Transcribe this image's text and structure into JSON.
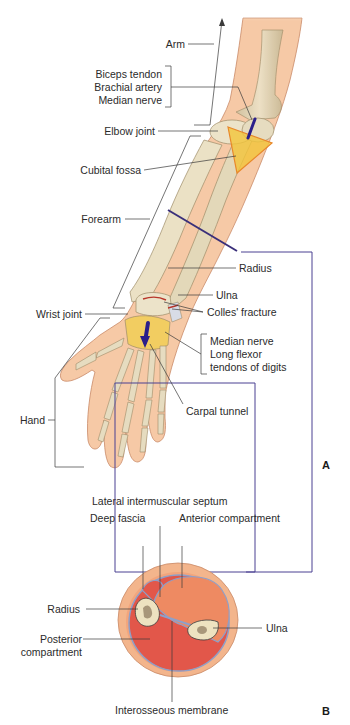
{
  "figure": {
    "panel_a": {
      "letter": "A",
      "labels": {
        "arm": "Arm",
        "biceps_tendon": "Biceps tendon",
        "brachial_artery": "Brachial artery",
        "median_nerve_elbow": "Median nerve",
        "elbow_joint": "Elbow joint",
        "cubital_fossa": "Cubital fossa",
        "forearm": "Forearm",
        "radius": "Radius",
        "ulna": "Ulna",
        "colles_fracture": "Colles' fracture",
        "wrist_joint": "Wrist joint",
        "median_nerve_wrist": "Median nerve",
        "long_flexor_1": "Long flexor",
        "long_flexor_2": "tendons of digits",
        "carpal_tunnel": "Carpal tunnel",
        "hand": "Hand"
      }
    },
    "panel_b": {
      "letter": "B",
      "labels": {
        "lateral_intermuscular_septum": "Lateral intermuscular septum",
        "deep_fascia": "Deep fascia",
        "anterior_compartment": "Anterior compartment",
        "radius": "Radius",
        "ulna": "Ulna",
        "posterior_1": "Posterior",
        "posterior_2": "compartment",
        "interosseous_membrane": "Interosseous membrane"
      }
    },
    "colors": {
      "skin": "#f6c9a6",
      "skin_outline": "#c98a68",
      "bone": "#e6dcc0",
      "bone_shade": "#b9a987",
      "cubital_fossa": "#f2c43a",
      "fossa_outline": "#e8882a",
      "nerve_blue": "#2b1f8a",
      "fracture_red": "#b8362a",
      "section_line": "#3a2f7a",
      "posterior_muscle": "#e2574a",
      "anterior_muscle": "#ee8a62",
      "fat_ring": "#f3b58c",
      "fascia": "#8f9fc8",
      "leader_line": "#3a3a3a"
    }
  }
}
